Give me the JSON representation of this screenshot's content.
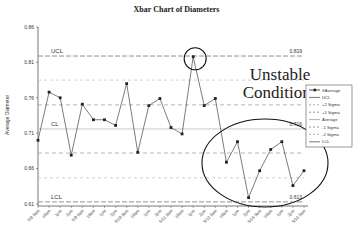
{
  "chart_data": {
    "type": "line",
    "title": "Xbar Chart of Diameters",
    "xlabel": "",
    "ylabel": "Average Diameter",
    "ylim": [
      0.61,
      0.86
    ],
    "yticks": [
      "0.86",
      "0.81",
      "0.76",
      "0.71",
      "0.66",
      "0.61"
    ],
    "categories": [
      "5/8 9am",
      "10am",
      "1pm",
      "2pm",
      "5/9 9am",
      "10am",
      "1pm",
      "2pm",
      "5/10 9am",
      "10am",
      "1pm",
      "2pm",
      "5/11 9am",
      "10am",
      "1pm",
      "2pm",
      "5/12 9am",
      "10am",
      "1pm",
      "2pm",
      "5/15 9am",
      "10am",
      "1pm",
      "2pm",
      "5/16 9am"
    ],
    "series": [
      {
        "name": "XAverage",
        "values": [
          0.7,
          0.768,
          0.76,
          0.679,
          0.751,
          0.729,
          0.729,
          0.721,
          0.78,
          0.683,
          0.749,
          0.759,
          0.718,
          0.709,
          0.818,
          0.749,
          0.759,
          0.669,
          0.698,
          0.619,
          0.657,
          0.687,
          0.698,
          0.636,
          0.657
        ]
      }
    ],
    "control_lines": {
      "UCL": 0.819,
      "plus_2_sigma": 0.785,
      "plus_1_sigma": 0.75,
      "CL": 0.716,
      "minus_1_sigma": 0.682,
      "minus_2_sigma": 0.647,
      "LCL": 0.613
    },
    "line_labels": {
      "ucl": "UCL",
      "cl": "CL",
      "lcl": "LCL",
      "ucl_value": "0.819",
      "cl_value": "0.716",
      "lcl_value": "0.613"
    },
    "legend": [
      "XAverage",
      "UCL",
      "+2 Sigma",
      "+1 Sigma",
      "Average",
      "-1 Sigma",
      "-2 Sigma",
      "LCL"
    ],
    "legend_position": "right",
    "annotations": [
      "Unstable",
      "Conditions"
    ],
    "grid": false
  }
}
